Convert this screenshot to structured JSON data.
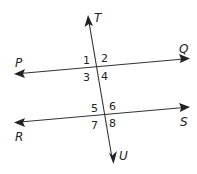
{
  "diagram": {
    "type": "parallel-lines-cut-by-transversal",
    "colors": {
      "line": "#333333",
      "text": "#222222",
      "background": "#ffffff"
    },
    "lines": [
      {
        "name": "PQ",
        "from_label": "P",
        "to_label": "Q",
        "x1": 15,
        "y1": 74,
        "x2": 190,
        "y2": 58
      },
      {
        "name": "RS",
        "from_label": "R",
        "to_label": "S",
        "x1": 15,
        "y1": 122,
        "x2": 190,
        "y2": 107
      },
      {
        "name": "TU",
        "from_label": "T",
        "to_label": "U",
        "x1": 88,
        "y1": 15,
        "x2": 113,
        "y2": 164
      }
    ],
    "point_labels": {
      "T": "T",
      "P": "P",
      "Q": "Q",
      "R": "R",
      "S": "S",
      "U": "U"
    },
    "angle_labels": {
      "a1": "1",
      "a2": "2",
      "a3": "3",
      "a4": "4",
      "a5": "5",
      "a6": "6",
      "a7": "7",
      "a8": "8"
    }
  }
}
